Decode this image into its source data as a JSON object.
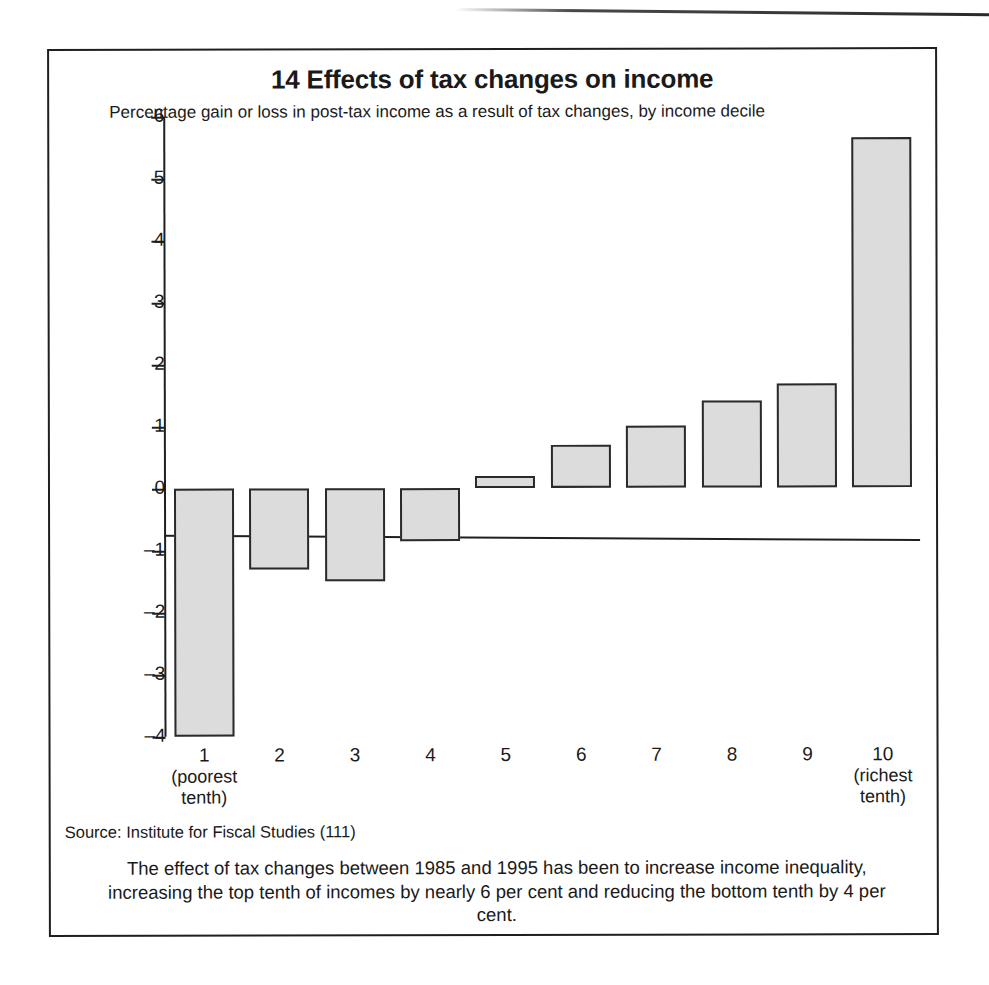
{
  "figure": {
    "title": "14 Effects of tax changes on income",
    "subtitle": "Percentage gain or loss in post-tax income as a result of tax changes, by income decile",
    "source": "Source: Institute for Fiscal Studies (111)",
    "caption": "The effect of tax changes between 1985 and 1995 has been to increase income inequality, increasing the top tenth of incomes by nearly 6 per cent and reducing the bottom tenth by 4 per cent.",
    "colors": {
      "bar_fill": "#dcdcdc",
      "bar_border": "#2a2a2a",
      "frame": "#1f1f1f",
      "text": "#1a1a1a"
    }
  },
  "chart_data": {
    "type": "bar",
    "title": "14 Effects of tax changes on income",
    "subtitle": "Percentage gain or loss in post-tax income as a result of tax changes, by income decile",
    "xlabel": "",
    "ylabel": "",
    "categories": [
      "1",
      "2",
      "3",
      "4",
      "5",
      "6",
      "7",
      "8",
      "9",
      "10"
    ],
    "category_sublabels": [
      "(poorest tenth)",
      "",
      "",
      "",
      "",
      "",
      "",
      "",
      "",
      "(richest tenth)"
    ],
    "values": [
      -4.0,
      -1.3,
      -1.5,
      -0.85,
      0.2,
      0.7,
      1.0,
      1.4,
      1.68,
      5.65
    ],
    "ylim": [
      -4,
      6
    ],
    "yticks": [
      6,
      5,
      4,
      3,
      2,
      1,
      0,
      -1,
      -2,
      -3,
      -4
    ],
    "ytick_labels": [
      "6",
      "5",
      "4",
      "3",
      "2",
      "1",
      "0",
      "–1",
      "–2",
      "–3",
      "–4"
    ],
    "grid": false,
    "legend": null
  }
}
